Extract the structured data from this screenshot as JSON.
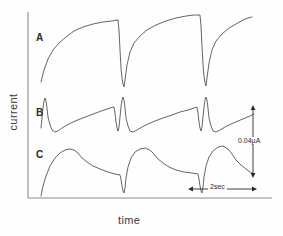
{
  "figure": {
    "axes": {
      "ylabel": "current",
      "xlabel": "time",
      "y_axis_x": 28,
      "x_axis_y": 198,
      "plot_left": 28,
      "plot_right": 272,
      "plot_top": 12
    },
    "trace_labels": {
      "a": "A",
      "b": "B",
      "c": "C"
    },
    "scale_bars": {
      "vertical_label": "0.04µA",
      "horizontal_label": "2sec"
    },
    "line_color": "#555555"
  },
  "chart_data": {
    "type": "line",
    "title": "",
    "xlabel": "time",
    "ylabel": "current",
    "grid": false,
    "legend": "none",
    "axis_ticks": [],
    "scale_bars": [
      {
        "orientation": "vertical",
        "label": "0.04µA",
        "x_px": 253,
        "y_start_px": 107,
        "y_end_px": 176
      },
      {
        "orientation": "horizontal",
        "label": "2sec",
        "y_px": 189,
        "x_start_px": 190,
        "x_end_px": 255
      }
    ],
    "series": [
      {
        "name": "A",
        "label": "A",
        "description": "Slow exponential rise to plateau followed by abrupt near-vertical fall; three repeating cycles (sawtooth-like).",
        "cycle_period_px": 83,
        "points": [
          [
            41,
            82
          ],
          [
            44,
            70
          ],
          [
            48,
            59
          ],
          [
            53,
            50
          ],
          [
            59,
            43
          ],
          [
            66,
            37
          ],
          [
            74,
            31
          ],
          [
            83,
            27
          ],
          [
            93,
            24
          ],
          [
            103,
            22
          ],
          [
            112,
            21
          ],
          [
            118,
            20
          ],
          [
            119,
            30
          ],
          [
            120,
            50
          ],
          [
            121,
            68
          ],
          [
            122,
            78
          ],
          [
            123,
            84
          ],
          [
            124,
            87
          ],
          [
            125,
            80
          ],
          [
            127,
            65
          ],
          [
            130,
            52
          ],
          [
            134,
            43
          ],
          [
            140,
            36
          ],
          [
            147,
            30
          ],
          [
            156,
            25
          ],
          [
            166,
            21
          ],
          [
            176,
            18
          ],
          [
            186,
            16
          ],
          [
            194,
            15
          ],
          [
            200,
            15
          ],
          [
            201,
            26
          ],
          [
            202,
            46
          ],
          [
            203,
            64
          ],
          [
            204,
            76
          ],
          [
            205,
            83
          ],
          [
            206,
            86
          ],
          [
            207,
            78
          ],
          [
            209,
            63
          ],
          [
            212,
            50
          ],
          [
            216,
            41
          ],
          [
            222,
            34
          ],
          [
            229,
            28
          ],
          [
            236,
            24
          ],
          [
            243,
            20
          ],
          [
            248,
            18
          ],
          [
            252,
            17
          ]
        ]
      },
      {
        "name": "B",
        "label": "B",
        "description": "Sharp narrow upward spike, rapid dip below baseline, then slow ramp to a shoulder before the next spike; three repeating cycles.",
        "cycle_period_px": 83,
        "points": [
          [
            41,
            128
          ],
          [
            42,
            118
          ],
          [
            43,
            108
          ],
          [
            44,
            101
          ],
          [
            45,
            98
          ],
          [
            46,
            101
          ],
          [
            47,
            108
          ],
          [
            48,
            117
          ],
          [
            50,
            125
          ],
          [
            52,
            130
          ],
          [
            55,
            132
          ],
          [
            58,
            131
          ],
          [
            62,
            128
          ],
          [
            67,
            125
          ],
          [
            73,
            122
          ],
          [
            80,
            119
          ],
          [
            88,
            116
          ],
          [
            96,
            113
          ],
          [
            104,
            110
          ],
          [
            110,
            108
          ],
          [
            114,
            107
          ],
          [
            115,
            113
          ],
          [
            116,
            122
          ],
          [
            117,
            128
          ],
          [
            118,
            131
          ],
          [
            119,
            127
          ],
          [
            120,
            117
          ],
          [
            121,
            107
          ],
          [
            122,
            100
          ],
          [
            123,
            97
          ],
          [
            124,
            100
          ],
          [
            125,
            108
          ],
          [
            126,
            118
          ],
          [
            128,
            126
          ],
          [
            130,
            131
          ],
          [
            133,
            132
          ],
          [
            137,
            130
          ],
          [
            142,
            127
          ],
          [
            148,
            124
          ],
          [
            155,
            121
          ],
          [
            163,
            118
          ],
          [
            172,
            115
          ],
          [
            180,
            112
          ],
          [
            188,
            110
          ],
          [
            194,
            108
          ],
          [
            197,
            107
          ],
          [
            198,
            113
          ],
          [
            199,
            122
          ],
          [
            200,
            128
          ],
          [
            201,
            131
          ],
          [
            202,
            127
          ],
          [
            203,
            117
          ],
          [
            204,
            107
          ],
          [
            205,
            100
          ],
          [
            206,
            97
          ],
          [
            207,
            100
          ],
          [
            208,
            108
          ],
          [
            209,
            118
          ],
          [
            211,
            126
          ],
          [
            213,
            131
          ],
          [
            216,
            132
          ],
          [
            220,
            130
          ],
          [
            225,
            127
          ],
          [
            231,
            124
          ],
          [
            238,
            121
          ],
          [
            245,
            118
          ],
          [
            250,
            116
          ],
          [
            254,
            114
          ]
        ]
      },
      {
        "name": "C",
        "label": "C",
        "description": "Rounded broad peak with fast rise and gradual decay, ending in a sharp downward notch; three repeating cycles.",
        "cycle_period_px": 83,
        "points": [
          [
            41,
            196
          ],
          [
            43,
            186
          ],
          [
            46,
            176
          ],
          [
            50,
            166
          ],
          [
            55,
            158
          ],
          [
            60,
            153
          ],
          [
            65,
            150
          ],
          [
            70,
            149
          ],
          [
            74,
            150
          ],
          [
            78,
            153
          ],
          [
            82,
            158
          ],
          [
            87,
            162
          ],
          [
            93,
            166
          ],
          [
            100,
            169
          ],
          [
            108,
            172
          ],
          [
            115,
            174
          ],
          [
            120,
            175
          ],
          [
            121,
            179
          ],
          [
            122,
            186
          ],
          [
            123,
            191
          ],
          [
            124,
            193
          ],
          [
            125,
            188
          ],
          [
            126,
            178
          ],
          [
            128,
            167
          ],
          [
            131,
            158
          ],
          [
            135,
            152
          ],
          [
            140,
            149
          ],
          [
            145,
            148
          ],
          [
            150,
            150
          ],
          [
            154,
            154
          ],
          [
            158,
            159
          ],
          [
            163,
            163
          ],
          [
            169,
            167
          ],
          [
            176,
            170
          ],
          [
            184,
            172
          ],
          [
            192,
            173
          ],
          [
            198,
            174
          ],
          [
            199,
            179
          ],
          [
            200,
            186
          ],
          [
            201,
            191
          ],
          [
            202,
            193
          ],
          [
            203,
            187
          ],
          [
            204,
            177
          ],
          [
            206,
            166
          ],
          [
            209,
            157
          ],
          [
            213,
            151
          ],
          [
            218,
            147
          ],
          [
            223,
            146
          ],
          [
            228,
            149
          ],
          [
            232,
            154
          ],
          [
            236,
            160
          ],
          [
            241,
            165
          ],
          [
            246,
            169
          ],
          [
            250,
            172
          ],
          [
            254,
            174
          ]
        ]
      }
    ]
  }
}
